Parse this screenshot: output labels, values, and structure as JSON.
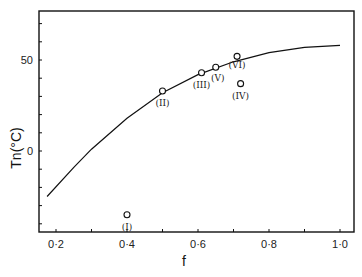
{
  "chart_data": {
    "type": "scatter",
    "title": "",
    "xlabel": "f",
    "ylabel": "Tn(°C)",
    "xlim": [
      0.2,
      1.04
    ],
    "ylim": [
      -45,
      77
    ],
    "xticks": [
      0.2,
      0.4,
      0.6,
      0.8,
      1.0
    ],
    "xtick_labels": [
      "0·2",
      "0·4",
      "0·6",
      "0·8",
      "1·0"
    ],
    "yticks": [
      0,
      50
    ],
    "ytick_labels": [
      "0",
      "50"
    ],
    "grid": false,
    "series": [
      {
        "name": "points",
        "marker": "open-circle",
        "points": [
          {
            "label": "(I)",
            "x": 0.4,
            "y": -35
          },
          {
            "label": "(II)",
            "x": 0.5,
            "y": 33
          },
          {
            "label": "(III)",
            "x": 0.61,
            "y": 43
          },
          {
            "label": "(V)",
            "x": 0.65,
            "y": 46
          },
          {
            "label": "(VI)",
            "x": 0.71,
            "y": 52
          },
          {
            "label": "(IV)",
            "x": 0.72,
            "y": 37
          }
        ]
      },
      {
        "name": "fit curve",
        "type": "line",
        "x": [
          0.175,
          0.25,
          0.3,
          0.4,
          0.5,
          0.6,
          0.7,
          0.8,
          0.9,
          1.0
        ],
        "y": [
          -25,
          -9,
          1,
          18,
          32,
          42,
          49,
          54,
          57,
          58
        ]
      }
    ]
  }
}
